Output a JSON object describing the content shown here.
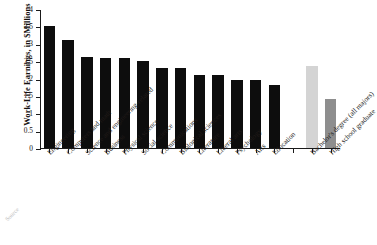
{
  "chart_data": {
    "type": "bar",
    "title": "",
    "xlabel": "",
    "ylabel": "Work-Life Earnings, in $Millions",
    "ylim": [
      0,
      4
    ],
    "yticks": [
      "0",
      "0.5",
      "1",
      "1.5",
      "2",
      "2.5",
      "3",
      "3.5",
      "4"
    ],
    "ytick_values": [
      0,
      0.5,
      1,
      1.5,
      2,
      2.5,
      3,
      3.5,
      4
    ],
    "grid": false,
    "legend": "none",
    "categories": [
      "Engineering",
      "Computers and math",
      "Science and engineering-related",
      "Business",
      "Physical science",
      "Social science",
      "Communications",
      "Biological sciences",
      "Literature",
      "Liberal arts",
      "Psychology",
      "Arts",
      "Education",
      "",
      "Bachelor's degree (all majors)",
      "High school graduate"
    ],
    "values": [
      3.52,
      3.12,
      2.61,
      2.6,
      2.6,
      2.51,
      2.3,
      2.3,
      2.09,
      2.09,
      1.97,
      1.97,
      1.8,
      null,
      2.35,
      1.42
    ],
    "bar_colors": [
      "#0d0d0d",
      "#0d0d0d",
      "#0d0d0d",
      "#0d0d0d",
      "#0d0d0d",
      "#0d0d0d",
      "#0d0d0d",
      "#0d0d0d",
      "#0d0d0d",
      "#0d0d0d",
      "#0d0d0d",
      "#0d0d0d",
      "#0d0d0d",
      "none",
      "#d4d4d4",
      "#8e8e8e"
    ]
  },
  "axis": {
    "y_title": "Work-Life Earnings, in $Millions"
  },
  "footer": {
    "source": "Source"
  }
}
